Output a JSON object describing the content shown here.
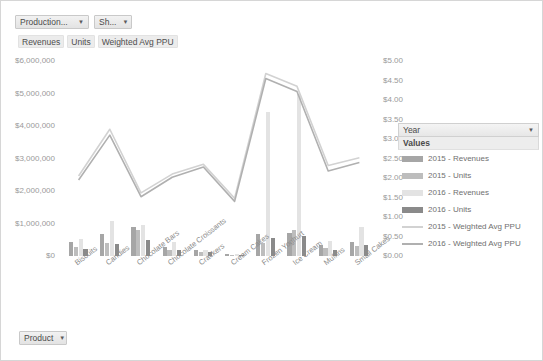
{
  "filters": {
    "production_label": "Production...",
    "show_label": "Sh...",
    "product_label": "Product",
    "caret": "▼"
  },
  "measures": [
    "Revenues",
    "Units",
    "Weighted Avg PPU"
  ],
  "legend": {
    "header": "Year",
    "subheader": "Values",
    "caret": "▼",
    "items": [
      {
        "label": "2015 - Revenues",
        "color": "#a6a6a6",
        "kind": "bar"
      },
      {
        "label": "2015 - Units",
        "color": "#bdbdbd",
        "kind": "bar"
      },
      {
        "label": "2016 - Revenues",
        "color": "#e3e3e3",
        "kind": "bar"
      },
      {
        "label": "2016 - Units",
        "color": "#8a8a8a",
        "kind": "bar"
      },
      {
        "label": "2015 - Weighted Avg PPU",
        "color": "#d2d2d2",
        "kind": "line"
      },
      {
        "label": "2016 - Weighted Avg PPU",
        "color": "#b0b0b0",
        "kind": "line"
      }
    ]
  },
  "chart_data": {
    "type": "bar",
    "title": "",
    "xlabel": "",
    "ylabel": "",
    "grid": false,
    "legend_position": "right",
    "categories": [
      "Biscuits",
      "Candies",
      "Chocolate Bars",
      "Chocolate Croissants",
      "Crackers",
      "Cream Cakes",
      "Frozen Yoghurt",
      "Ice Cream",
      "Muffins",
      "Small Cakes"
    ],
    "left_axis": {
      "label": "",
      "ticks": [
        "$0",
        "$1,000,000",
        "$2,000,000",
        "$3,000,000",
        "$4,000,000",
        "$5,000,000",
        "$6,000,000"
      ],
      "min": 0,
      "max": 6000000,
      "step": 1000000
    },
    "right_axis": {
      "label": "",
      "ticks": [
        "$0.00",
        "$0.50",
        "$1.00",
        "$1.50",
        "$2.00",
        "$2.50",
        "$3.00",
        "$3.50",
        "$4.00",
        "$4.50",
        "$5.00"
      ],
      "min": 0,
      "max": 5.0,
      "step": 0.5
    },
    "series": [
      {
        "name": "2015 - Revenues",
        "kind": "bar",
        "axis": "left",
        "color": "#a6a6a6",
        "values": [
          430000,
          690000,
          900000,
          290000,
          180000,
          60000,
          680000,
          700000,
          330000,
          420000
        ]
      },
      {
        "name": "2015 - Units",
        "kind": "bar",
        "axis": "left",
        "color": "#bdbdbd",
        "values": [
          290000,
          400000,
          790000,
          190000,
          130000,
          40000,
          400000,
          800000,
          240000,
          300000
        ]
      },
      {
        "name": "2016 - Revenues",
        "kind": "bar",
        "axis": "left",
        "color": "#e3e3e3",
        "values": [
          520000,
          1090000,
          940000,
          430000,
          200000,
          70000,
          4420000,
          4970000,
          460000,
          880000
        ]
      },
      {
        "name": "2016 - Units",
        "kind": "bar",
        "axis": "left",
        "color": "#8a8a8a",
        "values": [
          230000,
          370000,
          480000,
          170000,
          110000,
          30000,
          540000,
          630000,
          190000,
          330000
        ]
      },
      {
        "name": "2015 - Weighted Avg PPU",
        "kind": "line",
        "axis": "right",
        "color": "#d2d2d2",
        "values": [
          2.05,
          3.25,
          1.62,
          2.1,
          2.35,
          1.48,
          4.68,
          4.35,
          2.32,
          2.52
        ]
      },
      {
        "name": "2016 - Weighted Avg PPU",
        "kind": "line",
        "axis": "right",
        "color": "#b0b0b0",
        "values": [
          1.95,
          3.1,
          1.52,
          2.02,
          2.28,
          1.4,
          4.55,
          4.22,
          2.18,
          2.4
        ]
      }
    ]
  }
}
